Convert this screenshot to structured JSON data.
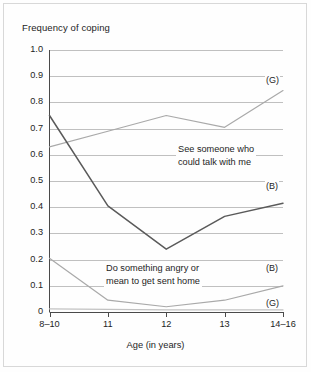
{
  "figure": {
    "title": "Frequency of coping",
    "xlabel": "Age (in years)"
  },
  "axes": {
    "ytick_labels": [
      "1.0",
      "0.9",
      "0.8",
      "0.7",
      "0.6",
      "0.5",
      "0.4",
      "0.3",
      "0.2",
      "0.1",
      "0"
    ],
    "xtick_labels": [
      "8–10",
      "11",
      "12",
      "13",
      "14–16"
    ]
  },
  "annotations": {
    "see_someone_line1": "See someone who",
    "see_someone_line2": "could talk with me",
    "do_something_line1": "Do something angry or",
    "do_something_line2": "mean to get sent home",
    "tag_girls_top": "(G)",
    "tag_boys_mid": "(B)",
    "tag_boys_low": "(B)",
    "tag_girls_low": "(G)"
  },
  "colors": {
    "line_dark": "#5a5a5a",
    "line_light": "#a9a9a9",
    "line_faint": "#c2c2c2",
    "grid": "#b9b9b9",
    "axis": "#4a4a4a",
    "background": "#fefefe"
  },
  "chart_data": {
    "type": "line",
    "title": "Frequency of coping",
    "xlabel": "Age (in years)",
    "ylabel": "Frequency of coping",
    "categories": [
      "8–10",
      "11",
      "12",
      "13",
      "14–16"
    ],
    "ylim": [
      0,
      1.0
    ],
    "ytick_values": [
      0,
      0.1,
      0.2,
      0.3,
      0.4,
      0.5,
      0.6,
      0.7,
      0.8,
      0.9,
      1.0
    ],
    "grid": true,
    "legend": "inline-annotations",
    "series": [
      {
        "name": "See someone who could talk with me (G)",
        "label": "See someone who could talk with me",
        "group": "(G)",
        "color": "#a9a9a9",
        "values": [
          0.63,
          0.69,
          0.75,
          0.705,
          0.845
        ]
      },
      {
        "name": "See someone who could talk with me (B)",
        "label": "See someone who could talk with me",
        "group": "(B)",
        "color": "#5a5a5a",
        "values": [
          0.75,
          0.405,
          0.24,
          0.365,
          0.415
        ]
      },
      {
        "name": "Do something angry or mean to get sent home (B)",
        "label": "Do something angry or mean to get sent home",
        "group": "(B)",
        "color": "#a9a9a9",
        "values": [
          0.205,
          0.045,
          0.02,
          0.045,
          0.1
        ]
      },
      {
        "name": "Do something angry or mean to get sent home (G)",
        "label": "Do something angry or mean to get sent home",
        "group": "(G)",
        "color": "#c2c2c2",
        "values": [
          0.012,
          0.01,
          0.008,
          0.008,
          0.008
        ]
      }
    ]
  }
}
